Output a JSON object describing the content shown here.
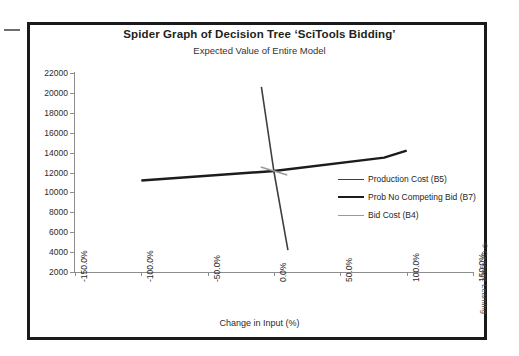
{
  "figure": {
    "title": "Spider Graph of Decision Tree ‘SciTools Bidding’",
    "subtitle": "Expected Value of Entire Model",
    "copyright": "© Cengage Learning"
  },
  "chart_data": {
    "type": "line",
    "title": "Spider Graph of Decision Tree ‘SciTools Bidding’",
    "subtitle": "Expected Value of Entire Model",
    "xlabel": "Change in Input (%)",
    "ylabel": "Expected Value",
    "xlim": [
      -150,
      150
    ],
    "ylim": [
      2000,
      22000
    ],
    "xtick_values": [
      -150,
      -100,
      -50,
      0,
      50,
      100,
      150
    ],
    "xtick_labels": [
      "-150.0%",
      "-100.0%",
      "-50.0%",
      "0.0%",
      "50.0%",
      "100.0%",
      "150.0%"
    ],
    "ytick_values": [
      2000,
      4000,
      6000,
      8000,
      10000,
      12000,
      14000,
      16000,
      18000,
      20000,
      22000
    ],
    "ytick_labels": [
      "2000",
      "4000",
      "6000",
      "8000",
      "10000",
      "12000",
      "14000",
      "16000",
      "18000",
      "20000",
      "22000"
    ],
    "grid": false,
    "legend_position": "center-right",
    "series": [
      {
        "name": "Production Cost (B5)",
        "color": "#3f3f3f",
        "width": 1.6,
        "points": [
          [
            -9.5,
            20600
          ],
          [
            0,
            12050
          ],
          [
            10.5,
            4200
          ]
        ]
      },
      {
        "name": "Prob No Competing Bid (B7)",
        "color": "#1c1c1c",
        "width": 2.4,
        "points": [
          [
            -100,
            11200
          ],
          [
            0,
            12150
          ],
          [
            83,
            13500
          ],
          [
            100,
            14200
          ]
        ]
      },
      {
        "name": "Bid Cost (B4)",
        "color": "#9a9a9a",
        "width": 1.6,
        "points": [
          [
            -10,
            12550
          ],
          [
            0,
            12150
          ],
          [
            10,
            11750
          ]
        ]
      }
    ]
  },
  "legend": {
    "items": [
      {
        "label": "Production Cost (B5)",
        "color": "#3f3f3f",
        "thickness": "1.6px"
      },
      {
        "label": "Prob No Competing Bid (B7)",
        "color": "#1c1c1c",
        "thickness": "2.6px"
      },
      {
        "label": "Bid Cost (B4)",
        "color": "#9a9a9a",
        "thickness": "1.6px"
      }
    ]
  }
}
